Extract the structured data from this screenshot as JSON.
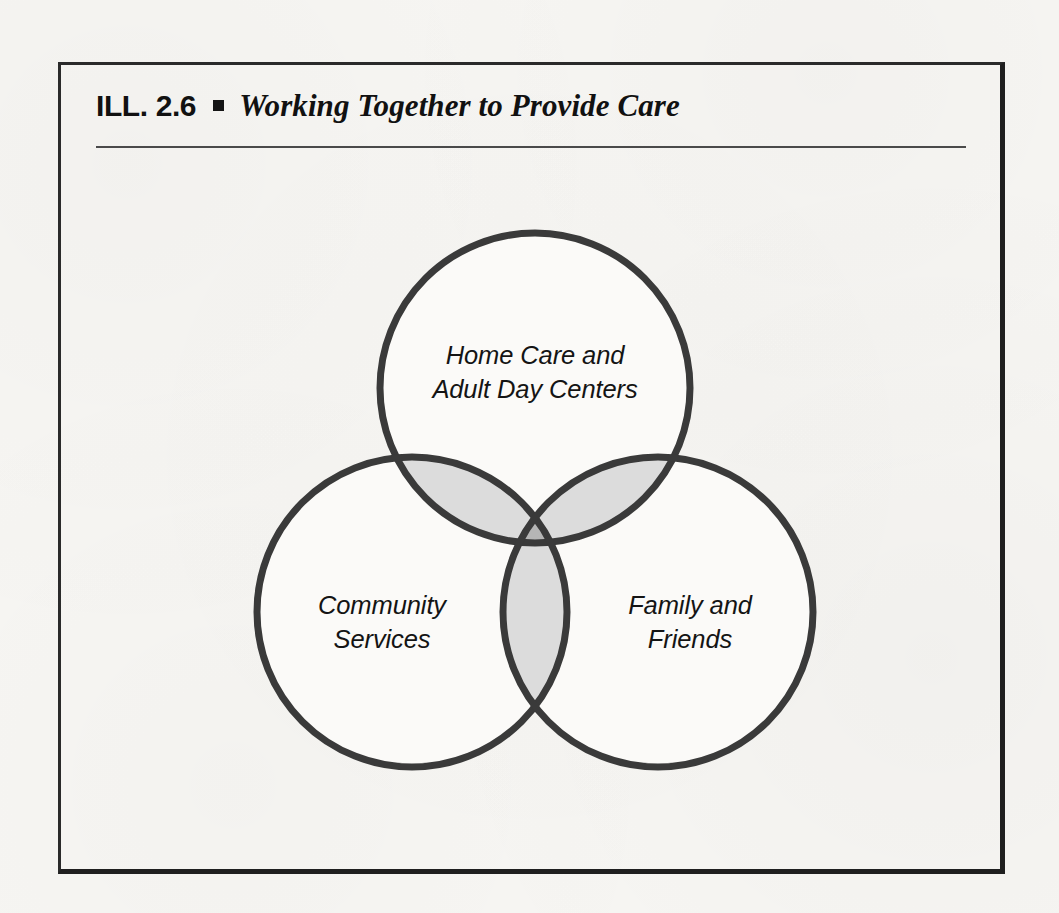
{
  "figure": {
    "label": "ILL. 2.6",
    "bullet_glyph": "square-bullet",
    "title": "Working Together to Provide Care"
  },
  "diagram": {
    "type": "venn-3-circle",
    "sets": [
      {
        "id": "home-care",
        "position": "top",
        "lines": [
          "Home Care and",
          "Adult Day Centers"
        ],
        "cx": 535,
        "cy": 388,
        "r": 155
      },
      {
        "id": "community-services",
        "position": "bottom-left",
        "lines": [
          "Community",
          "Services"
        ],
        "cx": 412,
        "cy": 612,
        "r": 155
      },
      {
        "id": "family-friends",
        "position": "bottom-right",
        "lines": [
          "Family and",
          "Friends"
        ],
        "cx": 658,
        "cy": 612,
        "r": 155
      }
    ],
    "colors": {
      "stroke": "#3a3a3a",
      "fill_single": "#fbfaf8",
      "fill_pair_overlap": "#dcdcdc",
      "fill_triple_overlap": "#b5b5b5",
      "frame": "#1f1f1f",
      "text": "#141414",
      "rule": "#4a4a4a"
    },
    "stroke_width": 7
  }
}
